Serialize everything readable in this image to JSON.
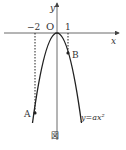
{
  "figure": {
    "caption": "図",
    "curve_label": "y=ax²",
    "axes": {
      "x_label": "x",
      "y_label": "y",
      "origin_label": "O"
    },
    "ticks": {
      "neg2": "−2",
      "pos1": "1"
    },
    "points": {
      "A": {
        "label": "A",
        "x": -2
      },
      "B": {
        "label": "B",
        "x": 1
      }
    },
    "colors": {
      "axis": "#444444",
      "curve": "#222222",
      "text": "#333333"
    }
  }
}
